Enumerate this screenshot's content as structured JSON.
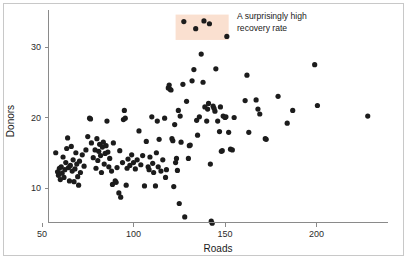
{
  "chart_data": {
    "type": "scatter",
    "title": "",
    "xlabel": "Roads",
    "ylabel": "Donors",
    "xlim": [
      45,
      232
    ],
    "ylim": [
      5.0,
      34.6
    ],
    "xticks": [
      50,
      100,
      150,
      200
    ],
    "yticks": [
      10,
      20,
      30
    ],
    "grid": false,
    "legend": null,
    "marker": "circle",
    "marker_color": "#1c1c1c",
    "marker_size": 2.6,
    "annotations": [
      {
        "name": "high-recovery-callout",
        "text_lines": [
          "A surprisingly high",
          "recovery rate"
        ],
        "highlight_color": "#fae0d0",
        "highlight_x_range": [
          123,
          152
        ],
        "highlight_y_range": [
          31.0,
          34.6
        ]
      }
    ],
    "points": [
      [
        57.5,
        15.0
      ],
      [
        58.5,
        12.3
      ],
      [
        59.0,
        11.8
      ],
      [
        59.5,
        12.8
      ],
      [
        60.0,
        11.2
      ],
      [
        60.5,
        13.0
      ],
      [
        61.0,
        12.1
      ],
      [
        61.5,
        14.4
      ],
      [
        62.0,
        11.5
      ],
      [
        62.5,
        12.6
      ],
      [
        63.0,
        13.6
      ],
      [
        63.5,
        15.6
      ],
      [
        64.0,
        17.1
      ],
      [
        64.5,
        12.9
      ],
      [
        65.0,
        11.0
      ],
      [
        65.5,
        13.2
      ],
      [
        66.0,
        15.9
      ],
      [
        66.5,
        12.4
      ],
      [
        67.0,
        14.0
      ],
      [
        67.5,
        10.9
      ],
      [
        68.0,
        12.7
      ],
      [
        68.5,
        15.0
      ],
      [
        69.0,
        13.4
      ],
      [
        69.5,
        11.6
      ],
      [
        70.0,
        10.4
      ],
      [
        70.5,
        13.8
      ],
      [
        71.0,
        12.2
      ],
      [
        72.0,
        14.7
      ],
      [
        73.0,
        13.1
      ],
      [
        74.0,
        15.4
      ],
      [
        75.0,
        17.3
      ],
      [
        76.0,
        19.9
      ],
      [
        76.5,
        19.8
      ],
      [
        77.0,
        16.4
      ],
      [
        78.0,
        14.3
      ],
      [
        79.0,
        15.4
      ],
      [
        79.5,
        12.8
      ],
      [
        80.0,
        17.0
      ],
      [
        80.5,
        13.9
      ],
      [
        81.0,
        15.2
      ],
      [
        81.5,
        16.2
      ],
      [
        82.0,
        14.6
      ],
      [
        82.5,
        12.2
      ],
      [
        83.0,
        15.8
      ],
      [
        83.5,
        16.5
      ],
      [
        84.0,
        13.4
      ],
      [
        84.5,
        14.9
      ],
      [
        85.0,
        16.0
      ],
      [
        85.5,
        19.5
      ],
      [
        86.0,
        15.1
      ],
      [
        86.5,
        13.0
      ],
      [
        87.0,
        14.2
      ],
      [
        88.0,
        12.4
      ],
      [
        88.5,
        10.5
      ],
      [
        89.0,
        16.4
      ],
      [
        90.0,
        11.0
      ],
      [
        90.5,
        10.8
      ],
      [
        91.0,
        12.9
      ],
      [
        92.0,
        9.3
      ],
      [
        92.5,
        15.3
      ],
      [
        93.0,
        8.7
      ],
      [
        94.0,
        13.6
      ],
      [
        94.5,
        19.7
      ],
      [
        95.0,
        21.0
      ],
      [
        95.5,
        19.9
      ],
      [
        96.0,
        10.4
      ],
      [
        96.5,
        12.8
      ],
      [
        97.0,
        14.1
      ],
      [
        98.0,
        13.2
      ],
      [
        99.0,
        14.7
      ],
      [
        100.0,
        13.6
      ],
      [
        101.0,
        12.7
      ],
      [
        102.0,
        14.0
      ],
      [
        103.0,
        18.1
      ],
      [
        104.0,
        13.3
      ],
      [
        105.0,
        14.6
      ],
      [
        106.0,
        10.3
      ],
      [
        107.0,
        16.6
      ],
      [
        108.0,
        13.0
      ],
      [
        108.5,
        12.6
      ],
      [
        109.0,
        14.4
      ],
      [
        110.0,
        20.1
      ],
      [
        110.5,
        13.5
      ],
      [
        111.0,
        12.2
      ],
      [
        112.0,
        10.3
      ],
      [
        112.5,
        15.0
      ],
      [
        113.0,
        19.5
      ],
      [
        113.5,
        13.0
      ],
      [
        114.0,
        16.9
      ],
      [
        115.0,
        12.4
      ],
      [
        116.0,
        14.0
      ],
      [
        117.0,
        19.9
      ],
      [
        117.5,
        11.5
      ],
      [
        118.0,
        12.6
      ],
      [
        119.0,
        24.2
      ],
      [
        119.5,
        24.6
      ],
      [
        120.0,
        24.0
      ],
      [
        120.5,
        23.9
      ],
      [
        121.0,
        17.0
      ],
      [
        121.5,
        16.7
      ],
      [
        122.0,
        10.2
      ],
      [
        122.5,
        19.0
      ],
      [
        123.0,
        13.6
      ],
      [
        123.5,
        14.2
      ],
      [
        124.0,
        12.5
      ],
      [
        124.5,
        21.0
      ],
      [
        125.0,
        7.8
      ],
      [
        125.5,
        20.2
      ],
      [
        126.0,
        16.5
      ],
      [
        127.0,
        24.7
      ],
      [
        127.5,
        33.6
      ],
      [
        128.0,
        5.9
      ],
      [
        129.0,
        22.3
      ],
      [
        130.0,
        14.2
      ],
      [
        130.5,
        16.0
      ],
      [
        131.0,
        16.1
      ],
      [
        132.0,
        25.2
      ],
      [
        133.0,
        26.8
      ],
      [
        134.0,
        32.6
      ],
      [
        134.5,
        19.6
      ],
      [
        135.0,
        17.5
      ],
      [
        136.0,
        20.1
      ],
      [
        137.0,
        29.0
      ],
      [
        138.0,
        25.0
      ],
      [
        138.5,
        33.7
      ],
      [
        139.0,
        21.5
      ],
      [
        140.0,
        19.5
      ],
      [
        140.5,
        21.2
      ],
      [
        141.0,
        22.0
      ],
      [
        141.5,
        33.3
      ],
      [
        142.0,
        13.4
      ],
      [
        142.5,
        5.3
      ],
      [
        143.0,
        5.0
      ],
      [
        143.5,
        21.6
      ],
      [
        144.0,
        21.3
      ],
      [
        144.5,
        20.9
      ],
      [
        145.0,
        26.9
      ],
      [
        146.0,
        19.5
      ],
      [
        147.0,
        18.0
      ],
      [
        147.5,
        21.5
      ],
      [
        148.0,
        15.2
      ],
      [
        148.5,
        15.3
      ],
      [
        149.0,
        20.2
      ],
      [
        150.0,
        20.0
      ],
      [
        150.5,
        20.1
      ],
      [
        151.0,
        31.5
      ],
      [
        152.0,
        17.9
      ],
      [
        153.0,
        15.5
      ],
      [
        154.0,
        15.4
      ],
      [
        155.0,
        20.0
      ],
      [
        161.0,
        22.4
      ],
      [
        162.0,
        26.0
      ],
      [
        163.0,
        17.9
      ],
      [
        167.0,
        22.5
      ],
      [
        168.0,
        21.2
      ],
      [
        169.0,
        20.5
      ],
      [
        172.0,
        17.0
      ],
      [
        172.5,
        16.9
      ],
      [
        179.0,
        23.0
      ],
      [
        184.0,
        19.2
      ],
      [
        187.0,
        21.0
      ],
      [
        199.0,
        27.5
      ],
      [
        200.5,
        21.7
      ],
      [
        228.0,
        20.2
      ]
    ]
  },
  "axes": {
    "x_tick_labels": [
      "50",
      "100",
      "150",
      "200"
    ],
    "y_tick_labels": [
      "10",
      "20",
      "30"
    ],
    "x_axis_title": "Roads",
    "y_axis_title": "Donors"
  },
  "annotation": {
    "line1": "A surprisingly high",
    "line2": "recovery rate"
  },
  "colors": {
    "highlight": "#fae0d0",
    "point": "#1c1c1c",
    "axis": "#8a8a8a",
    "text": "#1a1a1a",
    "frame": "#c8c8c8",
    "background": "#ffffff"
  }
}
